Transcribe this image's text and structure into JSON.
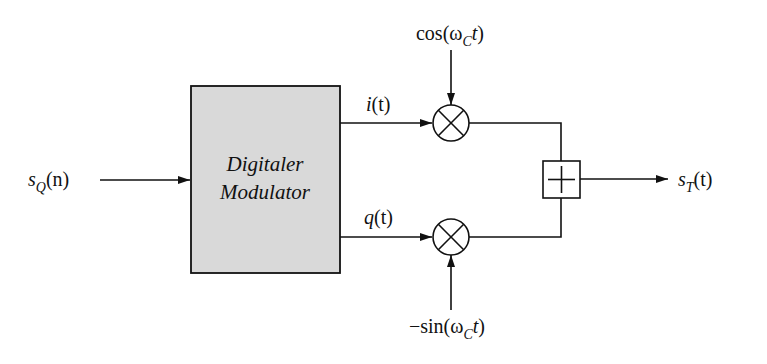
{
  "diagram": {
    "colors": {
      "line": "#111111",
      "block_fill": "#d9d9d9",
      "background": "#ffffff"
    },
    "input": {
      "symbol": "s",
      "subscript": "Q",
      "arg": "(n)"
    },
    "modulator": {
      "line1": "Digitaler",
      "line2": "Modulator"
    },
    "i_branch": {
      "signal": "i",
      "arg": "(t)"
    },
    "q_branch": {
      "signal": "q",
      "arg": "(t)"
    },
    "carrier_cos": {
      "prefix": "cos(ω",
      "subscript": "C",
      "suffix_var": "t",
      "close": ")"
    },
    "carrier_sin": {
      "prefix": "−sin(ω",
      "subscript": "C",
      "suffix_var": "t",
      "close": ")"
    },
    "mixer_symbol": "⊗",
    "adder_symbol": "+",
    "output": {
      "symbol": "s",
      "subscript": "T",
      "arg": "(t)"
    }
  }
}
